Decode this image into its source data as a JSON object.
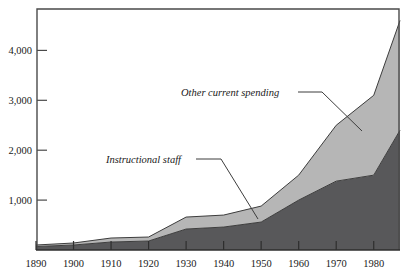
{
  "chart_data": {
    "type": "area",
    "stacked": true,
    "title": "",
    "subtitle": "",
    "xlabel": "",
    "ylabel": "",
    "grid": false,
    "legend_position": "inline-annotations",
    "x": [
      1890,
      1900,
      1910,
      1920,
      1930,
      1940,
      1950,
      1960,
      1970,
      1980,
      1987
    ],
    "xlim": [
      1890,
      1987
    ],
    "ylim": [
      0,
      4850
    ],
    "ytick_values": [
      1000,
      2000,
      3000,
      4000
    ],
    "ytick_labels": [
      "1,000",
      "2,000",
      "3,000",
      "4,000"
    ],
    "xtick_labels": [
      "1890",
      "1900",
      "1910",
      "1920",
      "1930",
      "1940",
      "1950",
      "1960",
      "1970",
      "1980"
    ],
    "series": [
      {
        "name": "Instructional staff",
        "color": "#58585a",
        "values": [
          70,
          100,
          160,
          180,
          420,
          460,
          560,
          1000,
          1380,
          1500,
          2400
        ]
      },
      {
        "name": "Other current spending",
        "color": "#b6b6b6",
        "values": [
          30,
          40,
          80,
          80,
          240,
          240,
          320,
          500,
          1120,
          1600,
          2200
        ]
      }
    ],
    "stacked_totals": [
      100,
      140,
      240,
      260,
      660,
      700,
      880,
      1500,
      2500,
      3100,
      4600
    ],
    "annotations": [
      {
        "name": "other-current-spending",
        "text": "Other current spending",
        "label_x": 181,
        "label_y": 96,
        "leader": [
          [
            298,
            92
          ],
          [
            322,
            92
          ],
          [
            362,
            131
          ]
        ]
      },
      {
        "name": "instructional-staff",
        "text": "Instructional staff",
        "label_x": 106,
        "label_y": 163,
        "leader": [
          [
            196,
            159
          ],
          [
            221,
            159
          ],
          [
            258,
            219
          ]
        ]
      }
    ]
  },
  "axes": {
    "axis_color": "#4a4a4a",
    "plot_background": "#ffffff"
  }
}
